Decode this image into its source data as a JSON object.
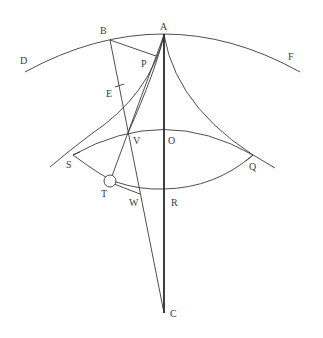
{
  "diagram": {
    "type": "geometric-construction",
    "labels": {
      "A": "A",
      "B": "B",
      "C": "C",
      "D": "D",
      "E": "E",
      "F": "F",
      "O": "O",
      "P": "P",
      "Q": "Q",
      "R": "R",
      "S": "S",
      "T": "T",
      "V": "V",
      "W": "W"
    },
    "elements": [
      "outer arc D-A-F",
      "inner arc S-V-O-Q",
      "lower arc T-W-R",
      "vertical line A-O-R-C",
      "line B-E-W-C",
      "line B-P",
      "cusp curves from A to S and Q",
      "line A-V-T",
      "circle at T",
      "line T-W"
    ],
    "colors": {
      "stroke": "#3a3a3a",
      "background": "#ffffff"
    }
  }
}
